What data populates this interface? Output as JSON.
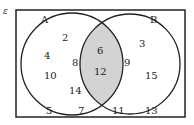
{
  "universal_symbol": "ε",
  "set_a": {
    "label": "A",
    "only": [
      "2",
      "4",
      "8",
      "10",
      "14"
    ]
  },
  "set_b": {
    "label": "B",
    "only": [
      "3",
      "9",
      "15"
    ]
  },
  "intersection": [
    "6",
    "12"
  ],
  "outside": [
    "5",
    "7",
    "11",
    "13"
  ],
  "colors": {
    "intersection_fill": "#d3d3d3",
    "stroke": "#222222"
  }
}
